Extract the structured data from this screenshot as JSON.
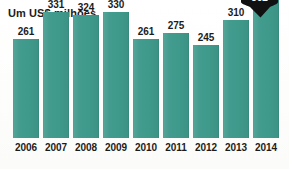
{
  "chart_data": {
    "type": "bar",
    "title": "Um US$ milhões",
    "xlabel": "",
    "ylabel": "",
    "categories": [
      "2006",
      "2007",
      "2008",
      "2009",
      "2010",
      "2011",
      "2012",
      "2013",
      "2014"
    ],
    "values": [
      261,
      331,
      324,
      330,
      261,
      275,
      245,
      310,
      362
    ],
    "ylim": [
      0,
      362
    ],
    "grid": false,
    "legend": null,
    "series": [
      {
        "name": "Um US$ milhões",
        "values": [
          261,
          331,
          324,
          330,
          261,
          275,
          245,
          310,
          362
        ]
      }
    ],
    "annotations": [
      {
        "category": "2014",
        "value": 362,
        "label": "362",
        "style": "black-pin-callout",
        "note": "cut off at top edge of image"
      }
    ],
    "colors": {
      "bar": "#3f9a8c",
      "annotation_pin": "#111111",
      "annotation_text": "#ffffff",
      "text": "#1c1c1c",
      "background": "#fdfdfb"
    }
  },
  "bars": [
    {
      "year": "2006",
      "value": 261,
      "label": "261"
    },
    {
      "year": "2007",
      "value": 331,
      "label": "331"
    },
    {
      "year": "2008",
      "value": 324,
      "label": "324"
    },
    {
      "year": "2009",
      "value": 330,
      "label": "330"
    },
    {
      "year": "2010",
      "value": 261,
      "label": "261"
    },
    {
      "year": "2011",
      "value": 275,
      "label": "275"
    },
    {
      "year": "2012",
      "value": 245,
      "label": "245"
    },
    {
      "year": "2013",
      "value": 310,
      "label": "310"
    },
    {
      "year": "2014",
      "value": 362,
      "label": "362"
    }
  ],
  "pin": {
    "label": "362"
  }
}
